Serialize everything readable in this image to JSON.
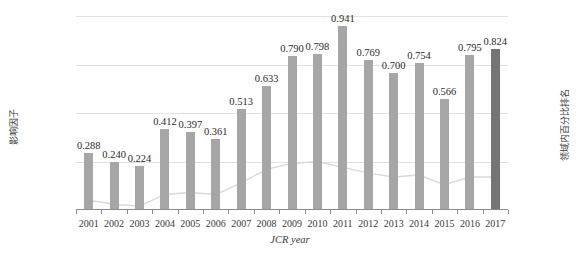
{
  "chart_data": {
    "type": "bar",
    "title": "",
    "xlabel": "JCR year",
    "ylabel": "影响因子",
    "y2label": "领域内百分比排名",
    "categories": [
      "2001",
      "2002",
      "2003",
      "2004",
      "2005",
      "2006",
      "2007",
      "2008",
      "2009",
      "2010",
      "2011",
      "2012",
      "2013",
      "2014",
      "2015",
      "2016",
      "2017"
    ],
    "ylim": [
      0,
      1.0
    ],
    "yticks": [
      "0.000",
      "0.250",
      "0.500",
      "0.750",
      "1.000"
    ],
    "ytick_values": [
      0,
      0.25,
      0.5,
      0.75,
      1.0
    ],
    "y2lim": [
      0,
      100
    ],
    "y2ticks": [
      "0%",
      "25%",
      "50%",
      "75%",
      "100%"
    ],
    "y2tick_values": [
      0,
      25,
      50,
      75,
      100
    ],
    "grid": true,
    "legend": "none",
    "series": [
      {
        "name": "影响因子",
        "type": "bar",
        "axis": "left",
        "color": "#a6a6a6",
        "highlight_color": "#757575",
        "highlight_index": 16,
        "values": [
          0.288,
          0.24,
          0.224,
          0.412,
          0.397,
          0.361,
          0.513,
          0.633,
          0.79,
          0.798,
          0.941,
          0.769,
          0.7,
          0.754,
          0.566,
          0.795,
          0.824
        ],
        "labels": [
          "0.288",
          "0.240",
          "0.224",
          "0.412",
          "0.397",
          "0.361",
          "0.513",
          "0.633",
          "0.790",
          "0.798",
          "0.941",
          "0.769",
          "0.700",
          "0.754",
          "0.566",
          "0.795",
          "0.824"
        ]
      },
      {
        "name": "领域内百分比排名",
        "type": "line",
        "axis": "right",
        "color": "#d9d9d9",
        "values": [
          5,
          3,
          2,
          8,
          9,
          8,
          14,
          21,
          24,
          25,
          22,
          19,
          17,
          18,
          13,
          17,
          17
        ]
      }
    ]
  }
}
